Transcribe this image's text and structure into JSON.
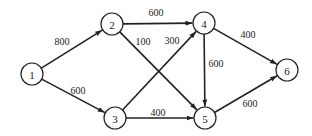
{
  "diagram": {
    "type": "directed-weighted-graph",
    "nodes": [
      {
        "id": "1",
        "label": "1",
        "x": 32,
        "y": 74
      },
      {
        "id": "2",
        "label": "2",
        "x": 112,
        "y": 24
      },
      {
        "id": "3",
        "label": "3",
        "x": 115,
        "y": 118
      },
      {
        "id": "4",
        "label": "4",
        "x": 204,
        "y": 23
      },
      {
        "id": "5",
        "label": "5",
        "x": 205,
        "y": 118
      },
      {
        "id": "6",
        "label": "6",
        "x": 287,
        "y": 70
      }
    ],
    "edges": [
      {
        "from": "1",
        "to": "2",
        "weight": "800",
        "lx": 62,
        "ly": 41
      },
      {
        "from": "1",
        "to": "3",
        "weight": "600",
        "lx": 78,
        "ly": 90
      },
      {
        "from": "2",
        "to": "4",
        "weight": "600",
        "lx": 156,
        "ly": 12
      },
      {
        "from": "2",
        "to": "5",
        "weight": "100",
        "lx": 143,
        "ly": 41
      },
      {
        "from": "3",
        "to": "4",
        "weight": "300",
        "lx": 172,
        "ly": 40
      },
      {
        "from": "3",
        "to": "5",
        "weight": "400",
        "lx": 158,
        "ly": 112
      },
      {
        "from": "4",
        "to": "5",
        "weight": "600",
        "lx": 216,
        "ly": 63
      },
      {
        "from": "4",
        "to": "6",
        "weight": "400",
        "lx": 248,
        "ly": 34
      },
      {
        "from": "5",
        "to": "6",
        "weight": "600",
        "lx": 250,
        "ly": 103
      }
    ],
    "node_radius": 11
  }
}
